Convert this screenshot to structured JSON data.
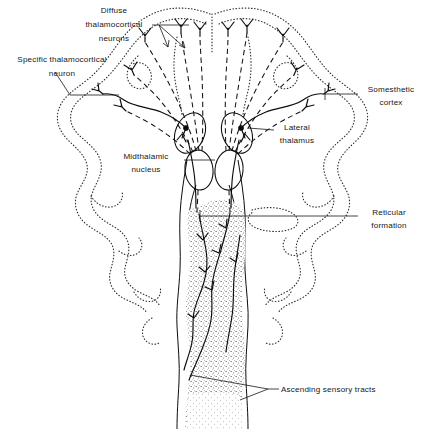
{
  "figure": {
    "width": 425,
    "height": 429,
    "background_color": "#ffffff",
    "ink_color": "#0b0c0e",
    "text_color": "#15161a"
  },
  "labels": {
    "diffuse_thalamocortical": {
      "lines": [
        "Diffuse",
        "thalamocortical",
        "neurons"
      ],
      "line1": "Diffuse",
      "line2": "thalamocortical",
      "line3": "neurons",
      "align": "middle"
    },
    "specific_thalamocortical": {
      "lines": [
        "Specific  thalamocortical",
        "neuron"
      ],
      "line1": "Specific  thalamocortical",
      "line2": "neuron",
      "align": "middle"
    },
    "somesthetic_cortex": {
      "lines": [
        "Somesthetic",
        "cortex"
      ],
      "line1": "Somesthetic",
      "line2": "cortex",
      "align": "middle"
    },
    "lateral_thalamus": {
      "lines": [
        "Lateral",
        "thalamus"
      ],
      "line1": "Lateral",
      "line2": "thalamus",
      "align": "middle"
    },
    "midthalamic_nucleus": {
      "lines": [
        "Midthalamic",
        "nucleus"
      ],
      "line1": "Midthalamic",
      "line2": "nucleus",
      "align": "middle"
    },
    "reticular_formation": {
      "lines": [
        "Reticular",
        "formation"
      ],
      "line1": "Reticular",
      "line2": "formation",
      "align": "middle"
    },
    "ascending_sensory_tracts": {
      "lines": [
        "Ascending  sensory  tracts"
      ],
      "line1": "Ascending  sensory  tracts",
      "align": "start"
    }
  },
  "structures": {
    "cortex_outline": "stippled convoluted cerebral cortex, bilateral, fanning outward and downward",
    "lateral_thalamus_left": "tilted oval with filled soma, left",
    "lateral_thalamus_right": "tilted oval with filled soma, right",
    "midthalamic_nucleus_left": "upright oval, left of midline",
    "midthalamic_nucleus_right": "upright oval, right of midline",
    "brainstem": "vertical brainstem and spinal cord with wavy lateral walls",
    "reticular_core": "stippled reticular formation core filling the brainstem",
    "ascending_tracts": "solid branching ascending sensory fibers within brainstem"
  },
  "legend_notes": {
    "dashed_fibers": "diffuse thalamocortical projections (dashed)",
    "solid_fibers": "specific thalamocortical projection and ascending sensory tracts (solid)"
  }
}
